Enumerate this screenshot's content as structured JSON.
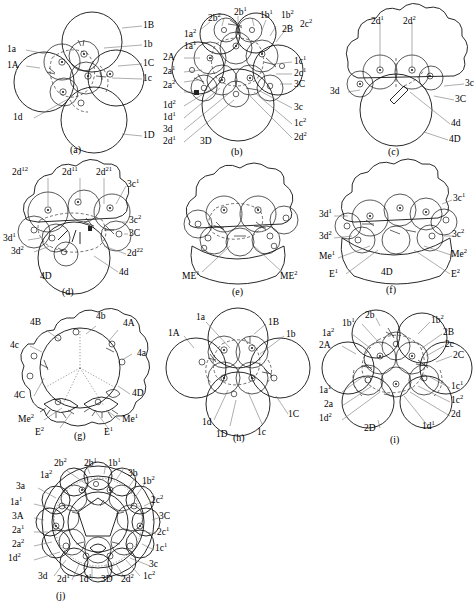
{
  "figure": {
    "panel_count": 10
  },
  "panels": [
    {
      "id": "a",
      "caption": "(a)",
      "labels": [
        {
          "text": "1B",
          "pos": "right"
        },
        {
          "text": "1b",
          "pos": "right"
        },
        {
          "text": "1C",
          "pos": "right"
        },
        {
          "text": "1c",
          "pos": "right"
        },
        {
          "text": "1D",
          "pos": "right"
        },
        {
          "text": "1a",
          "pos": "left"
        },
        {
          "text": "1A",
          "pos": "left"
        },
        {
          "text": "1d",
          "pos": "left"
        }
      ]
    },
    {
      "id": "b",
      "caption": "(b)",
      "labels": [
        {
          "text": "1a2",
          "html": "1a<sup>2</sup>",
          "pos": "topleft"
        },
        {
          "text": "2b2",
          "html": "2b<sup>2</sup>",
          "pos": "top"
        },
        {
          "text": "2b1",
          "html": "2b<sup>1</sup>",
          "pos": "top"
        },
        {
          "text": "1b1",
          "html": "1b<sup>1</sup>",
          "pos": "top"
        },
        {
          "text": "1b2",
          "html": "1b<sup>2</sup>",
          "pos": "top"
        },
        {
          "text": "2B",
          "pos": "top"
        },
        {
          "text": "2c2",
          "html": "2c<sup>2</sup>",
          "pos": "topright"
        },
        {
          "text": "1a1",
          "html": "1a<sup>1</sup>",
          "pos": "left"
        },
        {
          "text": "2A",
          "pos": "left"
        },
        {
          "text": "2a1",
          "html": "2a<sup>1</sup>",
          "pos": "left"
        },
        {
          "text": "2a2",
          "html": "2a<sup>2</sup>",
          "pos": "left"
        },
        {
          "text": "1d2",
          "html": "1d<sup>2</sup>",
          "pos": "left"
        },
        {
          "text": "1d1",
          "html": "1d<sup>1</sup>",
          "pos": "left"
        },
        {
          "text": "3d",
          "pos": "left"
        },
        {
          "text": "2d1",
          "html": "2d<sup>1</sup>",
          "pos": "left"
        },
        {
          "text": "3D",
          "pos": "bottom"
        },
        {
          "text": "1c1",
          "html": "1c<sup>1</sup>",
          "pos": "right"
        },
        {
          "text": "2c1",
          "html": "2c<sup>1</sup>",
          "pos": "right"
        },
        {
          "text": "3C",
          "pos": "right"
        },
        {
          "text": "3c",
          "pos": "right"
        },
        {
          "text": "1c2",
          "html": "1c<sup>2</sup>",
          "pos": "right"
        },
        {
          "text": "2d2",
          "html": "2d<sup>2</sup>",
          "pos": "right"
        }
      ]
    },
    {
      "id": "c",
      "caption": "(c)",
      "labels": [
        {
          "text": "2d1",
          "html": "2d<sup>1</sup>",
          "pos": "top"
        },
        {
          "text": "2d2",
          "html": "2d<sup>2</sup>",
          "pos": "top"
        },
        {
          "text": "3d",
          "pos": "left"
        },
        {
          "text": "3c",
          "pos": "right"
        },
        {
          "text": "3C",
          "pos": "right"
        },
        {
          "text": "4d",
          "pos": "right"
        },
        {
          "text": "4D",
          "pos": "right"
        }
      ]
    },
    {
      "id": "d",
      "caption": "(d)",
      "labels": [
        {
          "text": "2d12",
          "html": "2d<sup>12</sup>",
          "pos": "top"
        },
        {
          "text": "2d11",
          "html": "2d<sup>11</sup>",
          "pos": "top"
        },
        {
          "text": "2d21",
          "html": "2d<sup>21</sup>",
          "pos": "top"
        },
        {
          "text": "3c1",
          "html": "3c<sup>1</sup>",
          "pos": "right"
        },
        {
          "text": "3c2",
          "html": "3c<sup>2</sup>",
          "pos": "right"
        },
        {
          "text": "3C",
          "pos": "right"
        },
        {
          "text": "2d22",
          "html": "2d<sup>22</sup>",
          "pos": "right"
        },
        {
          "text": "4d",
          "pos": "right"
        },
        {
          "text": "3d1",
          "html": "3d<sup>1</sup>",
          "pos": "left"
        },
        {
          "text": "3d2",
          "html": "3d<sup>2</sup>",
          "pos": "left"
        },
        {
          "text": "4D",
          "pos": "bottom"
        }
      ]
    },
    {
      "id": "e",
      "caption": "(e)",
      "labels": [
        {
          "text": "ME1",
          "html": "ME<sup>1</sup>",
          "pos": "bottomleft"
        },
        {
          "text": "ME2",
          "html": "ME<sup>2</sup>",
          "pos": "bottomright"
        }
      ]
    },
    {
      "id": "f",
      "caption": "(f)",
      "labels": [
        {
          "text": "3c1",
          "html": "3c<sup>1</sup>",
          "pos": "right"
        },
        {
          "text": "3c2",
          "html": "3c<sup>2</sup>",
          "pos": "right"
        },
        {
          "text": "Me2",
          "html": "Me<sup>2</sup>",
          "pos": "right"
        },
        {
          "text": "E2",
          "html": "E<sup>2</sup>",
          "pos": "right"
        },
        {
          "text": "3d1",
          "html": "3d<sup>1</sup>",
          "pos": "left"
        },
        {
          "text": "3d2",
          "html": "3d<sup>2</sup>",
          "pos": "left"
        },
        {
          "text": "Me1",
          "html": "Me<sup>1</sup>",
          "pos": "left"
        },
        {
          "text": "E1",
          "html": "E<sup>1</sup>",
          "pos": "left"
        },
        {
          "text": "4D",
          "pos": "center"
        }
      ]
    },
    {
      "id": "g",
      "caption": "(g)",
      "labels": [
        {
          "text": "4B",
          "pos": "topleft"
        },
        {
          "text": "4b",
          "pos": "top"
        },
        {
          "text": "4A",
          "pos": "topright"
        },
        {
          "text": "4c",
          "pos": "left"
        },
        {
          "text": "4a",
          "pos": "right"
        },
        {
          "text": "4C",
          "pos": "left"
        },
        {
          "text": "4D",
          "pos": "right"
        },
        {
          "text": "Me2",
          "html": "Me<sup>2</sup>",
          "pos": "bottomleft"
        },
        {
          "text": "E2",
          "html": "E<sup>2</sup>",
          "pos": "bottom"
        },
        {
          "text": "Me1",
          "html": "Me<sup>1</sup>",
          "pos": "bottomright"
        },
        {
          "text": "E1",
          "html": "E<sup>1</sup>",
          "pos": "bottom"
        }
      ]
    },
    {
      "id": "h",
      "caption": "(h)",
      "labels": [
        {
          "text": "1a",
          "pos": "top"
        },
        {
          "text": "1B",
          "pos": "topright"
        },
        {
          "text": "1b",
          "pos": "right"
        },
        {
          "text": "1A",
          "pos": "left"
        },
        {
          "text": "1C",
          "pos": "right"
        },
        {
          "text": "1d",
          "pos": "bottom"
        },
        {
          "text": "1D",
          "pos": "bottom"
        },
        {
          "text": "1c",
          "pos": "bottom"
        }
      ]
    },
    {
      "id": "i",
      "caption": "(i)",
      "labels": [
        {
          "text": "1b1",
          "html": "1b<sup>1</sup>",
          "pos": "top"
        },
        {
          "text": "2b",
          "pos": "top"
        },
        {
          "text": "1a2",
          "html": "1a<sup>2</sup>",
          "pos": "topleft"
        },
        {
          "text": "2A",
          "pos": "left"
        },
        {
          "text": "1a1",
          "html": "1a<sup>1</sup>",
          "pos": "left"
        },
        {
          "text": "2a",
          "pos": "left"
        },
        {
          "text": "1d2",
          "html": "1d<sup>2</sup>",
          "pos": "left"
        },
        {
          "text": "1b2",
          "html": "1b<sup>2</sup>",
          "pos": "topright"
        },
        {
          "text": "2B",
          "pos": "right"
        },
        {
          "text": "2c",
          "pos": "right"
        },
        {
          "text": "2C",
          "pos": "right"
        },
        {
          "text": "1c1",
          "html": "1c<sup>1</sup>",
          "pos": "right"
        },
        {
          "text": "1c2",
          "html": "1c<sup>2</sup>",
          "pos": "right"
        },
        {
          "text": "2d",
          "pos": "right"
        },
        {
          "text": "1d1",
          "html": "1d<sup>1</sup>",
          "pos": "bottomright"
        },
        {
          "text": "2D",
          "pos": "bottom"
        }
      ]
    },
    {
      "id": "j",
      "caption": "(j)",
      "labels": [
        {
          "text": "2b2",
          "html": "2b<sup>2</sup>",
          "pos": "top"
        },
        {
          "text": "2b1",
          "html": "2b<sup>1</sup>",
          "pos": "top"
        },
        {
          "text": "1b1",
          "html": "1b<sup>1</sup>",
          "pos": "top"
        },
        {
          "text": "1a2",
          "html": "1a<sup>2</sup>",
          "pos": "topleft"
        },
        {
          "text": "3b",
          "pos": "topright"
        },
        {
          "text": "1b2",
          "html": "1b<sup>2</sup>",
          "pos": "topright"
        },
        {
          "text": "3a",
          "pos": "left"
        },
        {
          "text": "1a1",
          "html": "1a<sup>1</sup>",
          "pos": "left"
        },
        {
          "text": "3A",
          "pos": "left"
        },
        {
          "text": "2a1",
          "html": "2a<sup>1</sup>",
          "pos": "left"
        },
        {
          "text": "2a2",
          "html": "2a<sup>2</sup>",
          "pos": "left"
        },
        {
          "text": "1d2",
          "html": "1d<sup>2</sup>",
          "pos": "left"
        },
        {
          "text": "2c2",
          "html": "2c<sup>2</sup>",
          "pos": "right"
        },
        {
          "text": "3C",
          "pos": "right"
        },
        {
          "text": "2c1",
          "html": "2c<sup>1</sup>",
          "pos": "right"
        },
        {
          "text": "1c1",
          "html": "1c<sup>1</sup>",
          "pos": "right"
        },
        {
          "text": "3c",
          "pos": "right"
        },
        {
          "text": "3d",
          "pos": "bottom"
        },
        {
          "text": "2d1",
          "html": "2d<sup>1</sup>",
          "pos": "bottom"
        },
        {
          "text": "1d1",
          "html": "1d<sup>1</sup>",
          "pos": "bottom"
        },
        {
          "text": "3D",
          "pos": "bottom"
        },
        {
          "text": "2d2",
          "html": "2d<sup>2</sup>",
          "pos": "bottom"
        },
        {
          "text": "1c2",
          "html": "1c<sup>2</sup>",
          "pos": "bottom"
        }
      ]
    }
  ],
  "style": {
    "line_color": "#111111",
    "leader_color": "#6b6b6b",
    "background": "#ffffff"
  }
}
